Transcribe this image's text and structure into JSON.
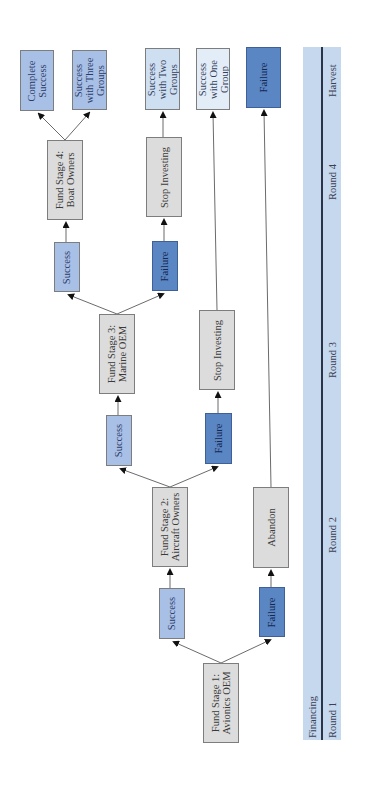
{
  "diagram": {
    "type": "decision-tree",
    "orientation": "rotated -90deg (reads bottom to top)",
    "colors": {
      "stage_box": "#dcdcdc",
      "success_box": "#a9c0e6",
      "failure_box": "#5b86c4",
      "light_outcome_box": "#e3edf8",
      "timeline_band": "#c5d8ee"
    },
    "nodes": {
      "stage1": "Fund Stage 1:\nAvionics OEM",
      "stage1_success": "Success",
      "stage1_failure": "Failure",
      "stage2": "Fund Stage 2:\nAircraft Owners",
      "abandon": "Abandon",
      "stage2_success": "Success",
      "stage2_failure": "Failure",
      "stage3": "Fund Stage 3:\nMarine OEM",
      "stop_investing_1": "Stop Investing",
      "stage3_success": "Success",
      "stage3_failure": "Failure",
      "stage4": "Fund Stage 4:\nBoat Owners",
      "stop_investing_2": "Stop Investing",
      "complete_success": "Complete\nSuccess",
      "success_three": "Success\nwith Three\nGroups",
      "success_two": "Success\nwith Two\nGroups",
      "success_one": "Success\nwith One\nGroup",
      "final_failure": "Failure"
    },
    "timeline": {
      "top_label": "Financing",
      "rounds": [
        "Round 1",
        "Round 2",
        "Round 3",
        "Round 4",
        "Harvest"
      ]
    }
  }
}
